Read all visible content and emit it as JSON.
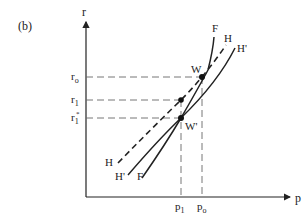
{
  "panel_label": "(b)",
  "axes": {
    "y_label": "r",
    "x_label": "p"
  },
  "y_ticks": {
    "r0": {
      "base": "r",
      "sub": "o"
    },
    "r1": {
      "base": "r",
      "sub": "1"
    },
    "r1_star": {
      "base": "r",
      "sub": "1",
      "sup": "*"
    }
  },
  "x_ticks": {
    "p1": {
      "base": "p",
      "sub": "1"
    },
    "p0": {
      "base": "p",
      "sub": "o"
    }
  },
  "curves": {
    "F": {
      "top_label": "F",
      "bottom_label": "F",
      "style": "solid"
    },
    "H": {
      "top_label": "H",
      "bottom_label": "H",
      "style": "dashed"
    },
    "H_prime": {
      "top_label": "H'",
      "bottom_label": "H'",
      "style": "solid"
    }
  },
  "points": {
    "W": "W",
    "W_prime": "W'"
  },
  "colors": {
    "ink": "#222222",
    "guide": "#666666",
    "background": "#ffffff"
  }
}
